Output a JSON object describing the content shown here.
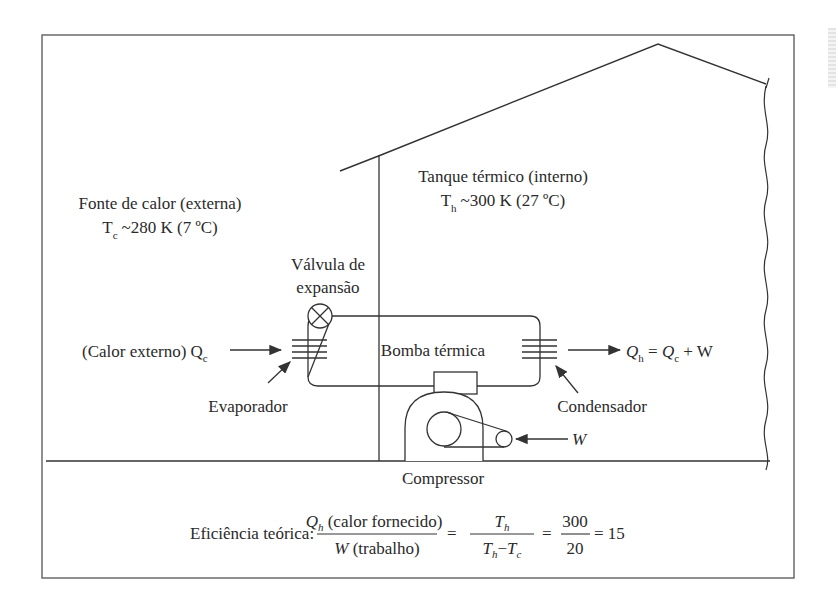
{
  "diagram": {
    "outside": {
      "label": "Fonte de calor (externa)",
      "temp_symbol": "T",
      "temp_sub": "c",
      "temp_value": "~280 K (7 ºC)"
    },
    "inside": {
      "label": "Tanque térmico (interno)",
      "temp_symbol": "T",
      "temp_sub": "h",
      "temp_value": "~300 K (27 ºC)"
    },
    "valve": {
      "label_line1": "Válvula de",
      "label_line2": "expansão"
    },
    "pump_label": "Bomba térmica",
    "evaporator_label": "Evaporador",
    "condenser_label": "Condensador",
    "compressor_label": "Compressor",
    "heat_in": {
      "prefix": "(Calor externo) Q",
      "sub": "c"
    },
    "heat_out": {
      "q": "Q",
      "q_sub": "h",
      "eq": " = ",
      "qc": "Q",
      "qc_sub": "c",
      "plus": " + W"
    },
    "work_label": "W",
    "efficiency": {
      "label": "Eficiência teórica:",
      "num1_q": "Q",
      "num1_sub": "h",
      "num1_text": " (calor fornecido)",
      "den1_w": "W",
      "den1_text": " (trabalho)",
      "eq1": "=",
      "num2_t": "T",
      "num2_sub": "h",
      "den2_t1": "T",
      "den2_sub1": "h",
      "den2_minus": "−",
      "den2_t2": "T",
      "den2_sub2": "c",
      "eq2": "=",
      "num3": "300",
      "den3": "20",
      "result": "= 15"
    }
  }
}
